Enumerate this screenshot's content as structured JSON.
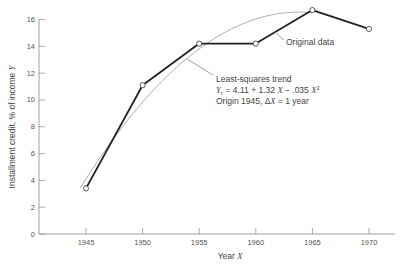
{
  "chart_data": {
    "type": "line",
    "title": "",
    "xlabel": "Year X",
    "ylabel": "Installment credit, % of income Y",
    "x": [
      1945,
      1950,
      1955,
      1960,
      1965,
      1970
    ],
    "series": [
      {
        "name": "Original data",
        "values": [
          3.4,
          11.1,
          14.2,
          14.2,
          16.7,
          15.3
        ],
        "style": "thick dark line with open circle markers"
      },
      {
        "name": "Least-squares trend",
        "equation": "Yc = 4.11 + 1.32X − .035X²",
        "coefficients": {
          "a": 4.11,
          "b": 1.32,
          "c": -0.035
        },
        "origin": 1945,
        "x_unit": "ΔX = 1 year",
        "x_range": [
          1944.5,
          1965
        ],
        "style": "thin gray curve"
      }
    ],
    "xlim": [
      1941,
      1973
    ],
    "ylim": [
      0,
      16
    ],
    "xticks": [
      "1945",
      "1950",
      "1955",
      "1960",
      "1965",
      "1970"
    ],
    "yticks": [
      "0",
      "2",
      "4",
      "6",
      "8",
      "10",
      "12",
      "14",
      "16"
    ],
    "grid": false,
    "legend": "none (inline annotations)",
    "annotations": [
      {
        "text": "Original data",
        "target": "data line near 1962"
      },
      {
        "lines": [
          "Least-squares trend",
          "Yc = 4.11 + 1.32 X − .035 X²",
          "Origin 1945, ΔX = 1 year"
        ],
        "target": "trend curve near 1954"
      }
    ]
  },
  "labels": {
    "xlabel_text": "Year ",
    "xlabel_var": "X",
    "ylabel_text": "Installment credit, % of income ",
    "ylabel_var": "Y",
    "annot_original": "Original data",
    "annot_trend_line1": "Least-squares trend",
    "annot_trend_eq_pre": " = 4.11 + 1.32 ",
    "annot_trend_eq_mid": " − .035 ",
    "annot_trend_line3_pre": "Origin 1945, Δ",
    "annot_trend_line3_post": " = 1 year"
  }
}
